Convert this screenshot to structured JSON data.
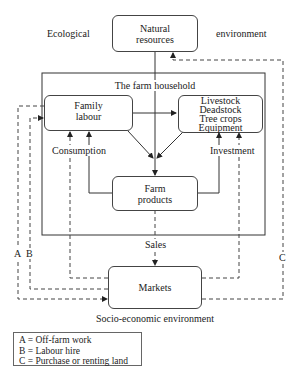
{
  "environment": {
    "ecological_left": "Ecological",
    "ecological_right": "environment",
    "socio_economic": "Socio-economic environment"
  },
  "household": {
    "title": "The farm household"
  },
  "nodes": {
    "natural_resources": [
      "Natural",
      "resources"
    ],
    "family_labour": [
      "Family",
      "labour"
    ],
    "capital": [
      "Livestock",
      "Deadstock",
      "Tree crops",
      "Equipment"
    ],
    "farm_products": [
      "Farm",
      "products"
    ],
    "markets": [
      "Markets"
    ]
  },
  "flows": {
    "consumption": "Consumption",
    "investment": "Investment",
    "sales": "Sales",
    "a": "A",
    "b": "B",
    "c": "C"
  },
  "legend": [
    "A = Off-farm work",
    "B = Labour hire",
    "C = Purchase or renting land"
  ]
}
